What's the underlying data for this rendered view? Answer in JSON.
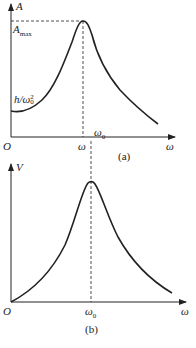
{
  "figure_a": {
    "caption": "(a)",
    "y_axis_label": "A",
    "x_axis_label": "ω",
    "origin_label": "O",
    "amax_label_main": "A",
    "amax_label_sub": "max",
    "intercept_label_main": "h/ω",
    "intercept_label_sup": "2",
    "intercept_label_sub": "0",
    "peak_x_label": "ω",
    "natural_freq_label_main": "ω",
    "natural_freq_label_sub": "0",
    "curve": "amplitude resonance curve, finite intercept h/ω0² at ω=0, peak A_max at ω slightly below ω0, decaying toward zero"
  },
  "figure_b": {
    "caption": "(b)",
    "y_axis_label": "V",
    "x_axis_label": "ω",
    "origin_label": "O",
    "peak_x_label_main": "ω",
    "peak_x_label_sub": "0",
    "curve": "velocity resonance curve, starts at origin, peak at ω0, decays"
  },
  "colors": {
    "line": "#222222",
    "background": "#ffffff"
  }
}
